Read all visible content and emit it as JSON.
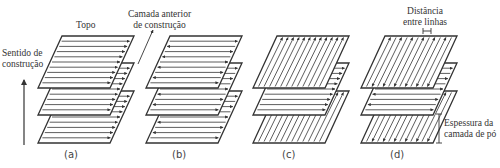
{
  "figure": {
    "type": "layered scan strategy diagram",
    "stroke_color": "#333333",
    "background": "#ffffff"
  },
  "annotations": {
    "top": "Topo",
    "build_direction_line1": "Sentido de",
    "build_direction_line2": "construção",
    "previous_layer_line1": "Camada anterior",
    "previous_layer_line2": "de construção",
    "hatch_distance_line1": "Distância",
    "hatch_distance_line2": "entre linhas",
    "layer_thickness_line1": "Espessura da",
    "layer_thickness_line2": "camada de pó"
  },
  "panels": [
    {
      "caption": "(a)",
      "description": "unidirectional scanning, same direction every layer",
      "layers": [
        "horizontal-right",
        "horizontal-right",
        "horizontal-right"
      ]
    },
    {
      "caption": "(b)",
      "description": "bidirectional (zig-zag) scanning, same orientation every layer",
      "layers": [
        "horizontal-alternating",
        "horizontal-alternating",
        "horizontal-alternating"
      ]
    },
    {
      "caption": "(c)",
      "description": "unidirectional scanning rotated 90° between layers",
      "layers": [
        "diagonal",
        "horizontal-right",
        "diagonal"
      ]
    },
    {
      "caption": "(d)",
      "description": "bidirectional scanning rotated 90° between layers",
      "layers": [
        "diagonal-alternating",
        "horizontal-alternating",
        "diagonal-alternating"
      ]
    }
  ]
}
